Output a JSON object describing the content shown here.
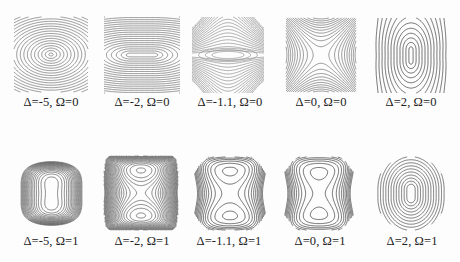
{
  "figure": {
    "rows": [
      {
        "omega": 0,
        "panels": [
          {
            "delta": -5,
            "label": "Δ=-5, Ω=0",
            "shape": "ellipses-wide",
            "box": [
              14,
              17,
              74,
              75
            ],
            "label_pos": [
              51,
              103
            ],
            "stroke": "#6a6a6a"
          },
          {
            "delta": -2,
            "label": "Δ=-2, Ω=0",
            "shape": "stadium-horizontal",
            "box": [
              104,
              17,
              76,
              76
            ],
            "label_pos": [
              142,
              103
            ],
            "stroke": "#6a6a6a"
          },
          {
            "delta": -1.1,
            "label": "Δ=-1.1, Ω=0",
            "shape": "bowtie",
            "box": [
              192,
              17,
              72,
              76
            ],
            "label_pos": [
              230,
              103
            ],
            "stroke": "#8a8a8a"
          },
          {
            "delta": 0,
            "label": "Δ=0, Ω=0",
            "shape": "saddle",
            "box": [
              286,
              18,
              70,
              74
            ],
            "label_pos": [
              321,
              103
            ],
            "stroke": "#6a6a6a"
          },
          {
            "delta": 2,
            "label": "Δ=2, Ω=0",
            "shape": "stadium-vertical",
            "box": [
              376,
              18,
              70,
              75
            ],
            "label_pos": [
              411,
              103
            ],
            "stroke": "#333333"
          }
        ]
      },
      {
        "omega": 1,
        "panels": [
          {
            "delta": -5,
            "label": "Δ=-5, Ω=1",
            "shape": "double-well-dense",
            "box": [
              15,
              157,
              73,
              73
            ],
            "label_pos": [
              51,
              242
            ],
            "stroke": "#555555"
          },
          {
            "delta": -2,
            "label": "Δ=-2, Ω=1",
            "shape": "double-well-barrel",
            "box": [
              104,
              156,
              74,
              74
            ],
            "label_pos": [
              142,
              242
            ],
            "stroke": "#555555"
          },
          {
            "delta": -1.1,
            "label": "Δ=-1.1, Ω=1",
            "shape": "figure-eight",
            "box": [
              194,
              157,
              72,
              73
            ],
            "label_pos": [
              229,
              242
            ],
            "stroke": "#333333"
          },
          {
            "delta": 0,
            "label": "Δ=0, Ω=1",
            "shape": "figure-eight-pinched",
            "box": [
              284,
              157,
              70,
              73
            ],
            "label_pos": [
              320,
              242
            ],
            "stroke": "#333333"
          },
          {
            "delta": 2,
            "label": "Δ=2, Ω=1",
            "shape": "single-well",
            "box": [
              376,
              157,
              70,
              73
            ],
            "label_pos": [
              412,
              242
            ],
            "stroke": "#444444"
          }
        ]
      }
    ]
  }
}
